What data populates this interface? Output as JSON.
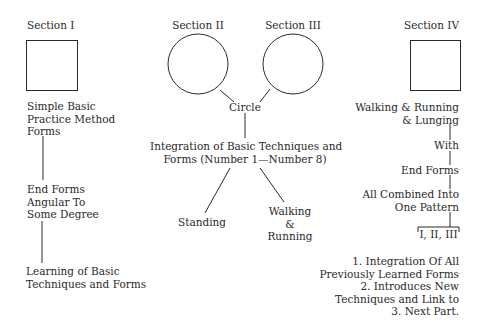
{
  "diagram": {
    "section1": {
      "title": "Section I",
      "shape": "square",
      "label_lines": [
        "Simple Basic",
        "Practice Method",
        "Forms"
      ],
      "step2_lines": [
        "End Forms",
        "Angular To",
        "Some Degree"
      ],
      "step3_lines": [
        "Learning of Basic",
        "Techniques and Forms"
      ]
    },
    "section2": {
      "title": "Section II",
      "shape": "circle"
    },
    "section3": {
      "title": "Section III",
      "shape": "circle"
    },
    "center": {
      "circle_label": "Circle",
      "integration_lines": [
        "Integration of Basic Techniques and",
        "Forms (Number 1—Number 8)"
      ],
      "branch_left": "Standing",
      "branch_right_lines": [
        "Walking",
        "&",
        "Running"
      ]
    },
    "section4": {
      "title": "Section IV",
      "shape": "square",
      "label_lines": [
        "Walking & Running",
        "& Lunging"
      ],
      "with": "With",
      "end_forms": "End Forms",
      "combined_lines": [
        "All Combined Into",
        "One Pattern"
      ],
      "bracket": "I, II, III",
      "notes": [
        "1. Integration Of All",
        "Previously Learned Forms",
        "2. Introduces New",
        "Techniques and Link to",
        "3. Next Part."
      ]
    },
    "colors": {
      "ink": "#2a2a2a",
      "background": "#ffffff"
    }
  }
}
